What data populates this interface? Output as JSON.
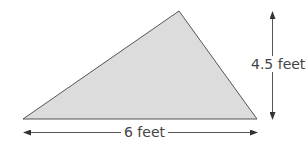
{
  "diagram": {
    "shape": "triangle",
    "fill_color": "#dcdcdc",
    "stroke_color": "#555555",
    "vertices": {
      "bottom_left": [
        23,
        119
      ],
      "apex": [
        179,
        11
      ],
      "bottom_right": [
        257,
        119
      ]
    },
    "dimensions": {
      "height": {
        "label": "4.5 feet",
        "value": 4.5,
        "unit": "feet"
      },
      "base": {
        "label": "6 feet",
        "value": 6,
        "unit": "feet"
      }
    }
  }
}
